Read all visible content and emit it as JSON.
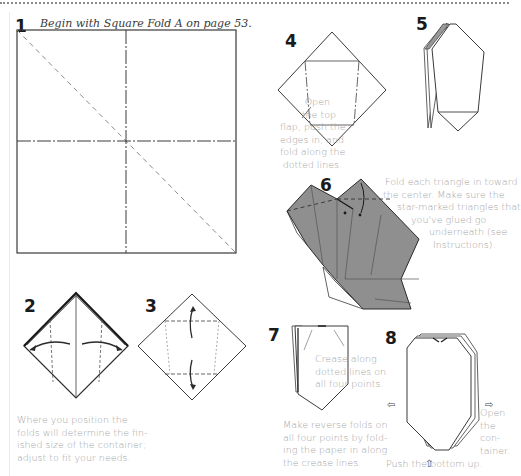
{
  "page": {
    "intro": "Begin with Square Fold A on page 53."
  },
  "steps": [
    {
      "number": "1",
      "note_lines": []
    },
    {
      "number": "2",
      "note_lines": [
        "Where you position the",
        "folds will determine the fin-",
        "ished size of the container;",
        "adjust to fit your needs."
      ]
    },
    {
      "number": "3",
      "note_lines": []
    },
    {
      "number": "4",
      "note_lines": [
        "Open",
        "the top",
        "flap, push the",
        "edges in, and",
        "fold along the",
        "dotted lines."
      ]
    },
    {
      "number": "5",
      "note_lines": []
    },
    {
      "number": "6",
      "note_lines": [
        "Fold each triangle in toward",
        "the center. Make sure the",
        "star-marked triangles that",
        "you've glued go",
        "underneath (see",
        "Instructions)."
      ]
    },
    {
      "number": "7",
      "note_lines": [
        "Crease along",
        "dotted lines on",
        "all four points."
      ],
      "note2_lines": [
        "Make reverse folds on",
        "all four points by fold-",
        "ing the paper in along",
        "the crease lines."
      ]
    },
    {
      "number": "8",
      "note_lines": [
        "Open",
        "the",
        "con-",
        "tainer."
      ],
      "note2_lines": [
        "Push the bottom up."
      ]
    }
  ],
  "colors": {
    "line": "#3a3a3a",
    "dashed": "#8a8a8a",
    "paper_shaded": "#8f8f8f",
    "text_gray": "#a3a3a3"
  }
}
